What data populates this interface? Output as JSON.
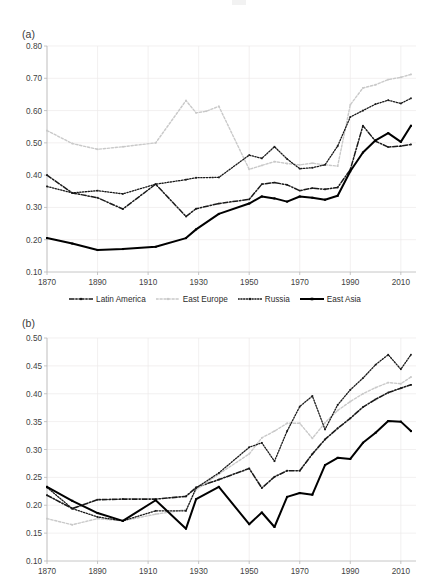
{
  "figure": {
    "width": 430,
    "height": 583,
    "background": "#ffffff"
  },
  "legend": {
    "position": "below-panel-a",
    "items": [
      {
        "label": "Latin America",
        "style": "dash-dot",
        "color": "#1a1a1a",
        "marker": "square"
      },
      {
        "label": "East Europe",
        "style": "dotted",
        "color": "#c9c9c9",
        "marker": "square"
      },
      {
        "label": "Russia",
        "style": "dash-dot-short",
        "color": "#1a1a1a",
        "marker": "square"
      },
      {
        "label": "East Asia",
        "style": "solid",
        "color": "#000000",
        "marker": "square"
      }
    ]
  },
  "chart_data": [
    {
      "id": "panel-a",
      "type": "line",
      "title": "(a)",
      "xlabel": "",
      "ylabel": "",
      "xlim": [
        1870,
        2016
      ],
      "ylim": [
        0.1,
        0.8
      ],
      "ytick_step": 0.1,
      "xticks": [
        1870,
        1890,
        1910,
        1930,
        1950,
        1970,
        1990,
        2010
      ],
      "xtick_labels": [
        "1870",
        "1890",
        "1910",
        "1930",
        "1950",
        "1970",
        "1990",
        "2010"
      ],
      "yticks": [
        0.1,
        0.2,
        0.3,
        0.4,
        0.5,
        0.6,
        0.7,
        0.8
      ],
      "ytick_labels": [
        "0.10",
        "0.20",
        "0.30",
        "0.40",
        "0.50",
        "0.60",
        "0.70",
        "0.80"
      ],
      "grid": true,
      "legend_position": "bottom-center",
      "series": [
        {
          "name": "Latin America",
          "style": "dash-dot",
          "color": "#1a1a1a",
          "width": 1.5,
          "x": [
            1870,
            1880,
            1890,
            1900,
            1913,
            1925,
            1929,
            1938,
            1950,
            1955,
            1960,
            1965,
            1970,
            1975,
            1980,
            1985,
            1990,
            1995,
            2000,
            2005,
            2010,
            2014
          ],
          "values": [
            0.4,
            0.345,
            0.33,
            0.295,
            0.372,
            0.272,
            0.296,
            0.312,
            0.325,
            0.372,
            0.377,
            0.37,
            0.352,
            0.36,
            0.356,
            0.362,
            0.417,
            0.553,
            0.505,
            0.487,
            0.49,
            0.495
          ]
        },
        {
          "name": "East Europe",
          "style": "dotted",
          "color": "#c9c9c9",
          "width": 1.4,
          "x": [
            1870,
            1880,
            1890,
            1900,
            1913,
            1925,
            1929,
            1933,
            1938,
            1950,
            1955,
            1960,
            1965,
            1970,
            1975,
            1980,
            1985,
            1990,
            1995,
            2000,
            2005,
            2010,
            2014
          ],
          "values": [
            0.538,
            0.498,
            0.48,
            0.488,
            0.5,
            0.631,
            0.593,
            0.598,
            0.613,
            0.418,
            0.43,
            0.442,
            0.436,
            0.432,
            0.437,
            0.432,
            0.428,
            0.618,
            0.67,
            0.68,
            0.696,
            0.703,
            0.712
          ]
        },
        {
          "name": "Russia",
          "style": "dotted-dense",
          "color": "#1a1a1a",
          "width": 1.3,
          "x": [
            1870,
            1880,
            1890,
            1900,
            1913,
            1925,
            1929,
            1938,
            1950,
            1955,
            1960,
            1965,
            1970,
            1975,
            1980,
            1985,
            1990,
            1995,
            2000,
            2005,
            2010,
            2014
          ],
          "values": [
            0.365,
            0.345,
            0.352,
            0.342,
            0.372,
            0.386,
            0.392,
            0.393,
            0.462,
            0.452,
            0.488,
            0.45,
            0.42,
            0.423,
            0.432,
            0.49,
            0.58,
            0.6,
            0.62,
            0.632,
            0.622,
            0.638
          ]
        },
        {
          "name": "East Asia",
          "style": "solid",
          "color": "#000000",
          "width": 2.0,
          "x": [
            1870,
            1880,
            1890,
            1900,
            1913,
            1925,
            1929,
            1938,
            1950,
            1955,
            1960,
            1965,
            1970,
            1975,
            1980,
            1985,
            1990,
            1995,
            2000,
            2005,
            2010,
            2014
          ],
          "values": [
            0.205,
            0.188,
            0.168,
            0.171,
            0.178,
            0.205,
            0.232,
            0.28,
            0.312,
            0.334,
            0.328,
            0.318,
            0.334,
            0.33,
            0.324,
            0.336,
            0.412,
            0.47,
            0.508,
            0.53,
            0.503,
            0.553
          ]
        }
      ]
    },
    {
      "id": "panel-b",
      "type": "line",
      "title": "(b)",
      "xlabel": "",
      "ylabel": "",
      "xlim": [
        1870,
        2016
      ],
      "ylim": [
        0.1,
        0.5
      ],
      "ytick_step": 0.05,
      "xticks": [
        1870,
        1890,
        1910,
        1930,
        1950,
        1970,
        1990,
        2010
      ],
      "xtick_labels": [
        "1870",
        "1890",
        "1910",
        "1930",
        "1950",
        "1970",
        "1990",
        "2010"
      ],
      "yticks": [
        0.1,
        0.15,
        0.2,
        0.25,
        0.3,
        0.35,
        0.4,
        0.45,
        0.5
      ],
      "ytick_labels": [
        "0.10",
        "0.15",
        "0.20",
        "0.25",
        "0.30",
        "0.35",
        "0.40",
        "0.45",
        "0.50"
      ],
      "grid": true,
      "legend_position": "none",
      "series": [
        {
          "name": "Latin America",
          "style": "dash-dot",
          "color": "#1a1a1a",
          "width": 1.6,
          "x": [
            1870,
            1880,
            1890,
            1900,
            1913,
            1925,
            1929,
            1938,
            1950,
            1955,
            1960,
            1965,
            1970,
            1975,
            1980,
            1985,
            1990,
            1995,
            2000,
            2005,
            2010,
            2014
          ],
          "values": [
            0.218,
            0.194,
            0.21,
            0.211,
            0.211,
            0.216,
            0.232,
            0.246,
            0.266,
            0.231,
            0.251,
            0.262,
            0.262,
            0.292,
            0.318,
            0.338,
            0.356,
            0.376,
            0.39,
            0.402,
            0.41,
            0.416
          ]
        },
        {
          "name": "East Europe",
          "style": "dotted",
          "color": "#c9c9c9",
          "width": 1.4,
          "x": [
            1870,
            1880,
            1890,
            1900,
            1913,
            1925,
            1929,
            1938,
            1950,
            1955,
            1960,
            1965,
            1970,
            1975,
            1980,
            1985,
            1990,
            1995,
            2000,
            2005,
            2010,
            2014
          ],
          "values": [
            0.176,
            0.165,
            0.176,
            0.172,
            0.184,
            0.192,
            0.228,
            0.256,
            0.292,
            0.321,
            0.333,
            0.347,
            0.347,
            0.32,
            0.348,
            0.37,
            0.386,
            0.4,
            0.411,
            0.42,
            0.418,
            0.43
          ]
        },
        {
          "name": "Russia",
          "style": "dotted-dense",
          "color": "#1a1a1a",
          "width": 1.3,
          "x": [
            1870,
            1880,
            1890,
            1900,
            1913,
            1925,
            1929,
            1938,
            1950,
            1955,
            1960,
            1965,
            1970,
            1975,
            1980,
            1985,
            1990,
            1995,
            2000,
            2005,
            2010,
            2014
          ],
          "values": [
            0.232,
            0.194,
            0.179,
            0.172,
            0.19,
            0.19,
            0.231,
            0.258,
            0.304,
            0.312,
            0.279,
            0.333,
            0.377,
            0.396,
            0.336,
            0.38,
            0.407,
            0.428,
            0.452,
            0.47,
            0.444,
            0.47
          ]
        },
        {
          "name": "East Asia",
          "style": "solid",
          "color": "#000000",
          "width": 2.0,
          "x": [
            1870,
            1880,
            1890,
            1900,
            1913,
            1925,
            1929,
            1938,
            1950,
            1955,
            1960,
            1965,
            1970,
            1975,
            1980,
            1985,
            1990,
            1995,
            2000,
            2005,
            2010,
            2014
          ],
          "values": [
            0.233,
            0.208,
            0.186,
            0.172,
            0.209,
            0.158,
            0.211,
            0.233,
            0.166,
            0.187,
            0.161,
            0.215,
            0.222,
            0.219,
            0.272,
            0.285,
            0.283,
            0.312,
            0.33,
            0.351,
            0.35,
            0.333
          ]
        }
      ]
    }
  ]
}
